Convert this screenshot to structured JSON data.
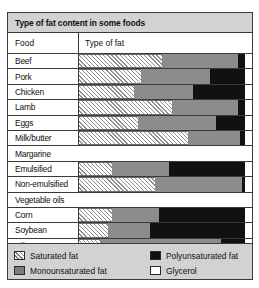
{
  "chart_data": {
    "type": "bar",
    "subtype": "stacked-horizontal-100",
    "title": "Type of fat content in some foods",
    "xlabel": "",
    "ylabel": "",
    "column_headers": [
      "Food",
      "Type of fat"
    ],
    "xlim": [
      0,
      100
    ],
    "grid": false,
    "legend_position": "bottom",
    "series": [
      {
        "name": "Saturated fat",
        "key": "sat",
        "color": "#ffffff",
        "pattern": "diagonal-hatch"
      },
      {
        "name": "Monounsaturated fat",
        "key": "mono",
        "color": "#8c8c8c",
        "pattern": "solid"
      },
      {
        "name": "Polyunsaturated fat",
        "key": "poly",
        "color": "#111111",
        "pattern": "solid"
      },
      {
        "name": "Glycerol",
        "key": "gly",
        "color": "#ffffff",
        "pattern": "solid"
      }
    ],
    "groups": [
      {
        "group_label": "",
        "rows": [
          {
            "category": "Beef",
            "sat": 48,
            "mono": 44,
            "poly": 4,
            "gly": 4
          },
          {
            "category": "Pork",
            "sat": 36,
            "mono": 40,
            "poly": 20,
            "gly": 4
          },
          {
            "category": "Chicken",
            "sat": 32,
            "mono": 34,
            "poly": 30,
            "gly": 4
          },
          {
            "category": "Lamb",
            "sat": 54,
            "mono": 38,
            "poly": 4,
            "gly": 4
          },
          {
            "category": "Eggs",
            "sat": 34,
            "mono": 45,
            "poly": 17,
            "gly": 4
          },
          {
            "category": "Milk/butter",
            "sat": 63,
            "mono": 30,
            "poly": 3,
            "gly": 4
          }
        ]
      },
      {
        "group_label": "Margarine",
        "rows": [
          {
            "category": "Emulsified",
            "sat": 19,
            "mono": 33,
            "poly": 44,
            "gly": 4
          },
          {
            "category": "Non-emulsified",
            "sat": 44,
            "mono": 50,
            "poly": 2,
            "gly": 4
          }
        ]
      },
      {
        "group_label": "Vegetable oils",
        "rows": [
          {
            "category": "Corn",
            "sat": 19,
            "mono": 27,
            "poly": 50,
            "gly": 4
          },
          {
            "category": "Soybean",
            "sat": 17,
            "mono": 24,
            "poly": 55,
            "gly": 4
          },
          {
            "category": "Olive",
            "sat": 12,
            "mono": 70,
            "poly": 14,
            "gly": 4
          }
        ]
      }
    ],
    "legend_entries": [
      "Saturated fat",
      "Polyunsaturated fat",
      "Monounsaturated fat",
      "Glycerol"
    ]
  },
  "title": "Type of fat content in some foods",
  "header": {
    "food": "Food",
    "type_of_fat": "Type of fat"
  },
  "rows": {
    "beef": "Beef",
    "pork": "Pork",
    "chicken": "Chicken",
    "lamb": "Lamb",
    "eggs": "Eggs",
    "milk_butter": "Milk/butter",
    "margarine": "Margarine",
    "emulsified": "Emulsified",
    "non_emulsified": "Non-emulsified",
    "vegetable_oils": "Vegetable oils",
    "corn": "Corn",
    "soybean": "Soybean",
    "olive": "Olive"
  },
  "legend": {
    "saturated": "Saturated fat",
    "polyunsaturated": "Polyunsaturated fat",
    "monounsaturated": "Monounsaturated fat",
    "glycerol": "Glycerol"
  },
  "colors": {
    "saturated": "#ffffff",
    "monounsaturated": "#8c8c8c",
    "polyunsaturated": "#111111",
    "glycerol": "#ffffff",
    "band": "#d2d2d2",
    "border": "#3a3a3a"
  }
}
